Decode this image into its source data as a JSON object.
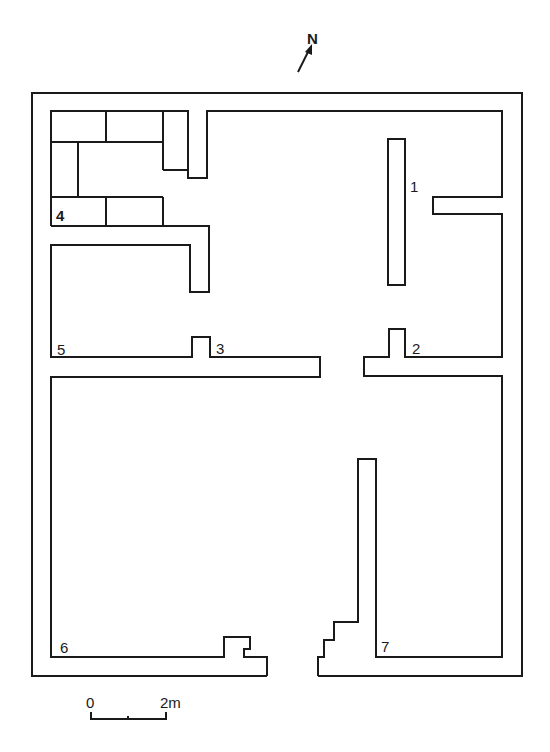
{
  "north_arrow": {
    "label": "N"
  },
  "rooms": [
    {
      "id": "1",
      "label": "1"
    },
    {
      "id": "2",
      "label": "2"
    },
    {
      "id": "3",
      "label": "3"
    },
    {
      "id": "4",
      "label": "4"
    },
    {
      "id": "5",
      "label": "5"
    },
    {
      "id": "6",
      "label": "6"
    },
    {
      "id": "7",
      "label": "7"
    }
  ],
  "scale_bar": {
    "start_label": "0",
    "end_label": "2m"
  },
  "colors": {
    "line": "#1a1a1a",
    "background": "#ffffff"
  }
}
